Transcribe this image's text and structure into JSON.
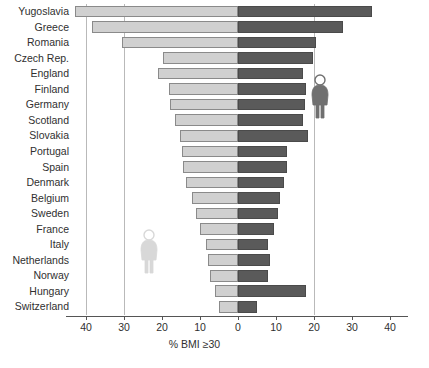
{
  "chart_data": {
    "type": "bar",
    "orientation": "horizontal-diverging",
    "title": "",
    "xlabel": "% BMI ≥30",
    "ylabel": "",
    "xlim": [
      -44,
      44
    ],
    "grid": true,
    "legend_position": "none",
    "x_ticks": [
      {
        "value": -40,
        "label": "40"
      },
      {
        "value": -30,
        "label": "30"
      },
      {
        "value": -20,
        "label": "20"
      },
      {
        "value": -10,
        "label": "10"
      },
      {
        "value": 0,
        "label": "0"
      },
      {
        "value": 10,
        "label": "10"
      },
      {
        "value": 20,
        "label": "20"
      },
      {
        "value": 30,
        "label": "30"
      },
      {
        "value": 40,
        "label": "40"
      }
    ],
    "gridlines": [
      -40,
      -30,
      20
    ],
    "categories": [
      "Yugoslavia",
      "Greece",
      "Romania",
      "Czech Rep.",
      "England",
      "Finland",
      "Germany",
      "Scotland",
      "Slovakia",
      "Portugal",
      "Spain",
      "Denmark",
      "Belgium",
      "Sweden",
      "France",
      "Italy",
      "Netherlands",
      "Norway",
      "Hungary",
      "Switzerland"
    ],
    "series": [
      {
        "name": "Women",
        "side": "left",
        "color": "#d0d0d0",
        "values": [
          42.8,
          38.3,
          30.5,
          19.7,
          21.0,
          18.2,
          18.0,
          16.5,
          15.2,
          14.7,
          14.5,
          13.7,
          12.2,
          11.0,
          10.0,
          8.4,
          8.0,
          7.5,
          6.0,
          5.0
        ]
      },
      {
        "name": "Men",
        "side": "right",
        "color": "#5a5a5a",
        "values": [
          35.3,
          27.5,
          20.5,
          19.8,
          17.0,
          18.0,
          17.5,
          17.0,
          18.5,
          13.0,
          13.0,
          12.0,
          11.0,
          10.5,
          9.5,
          8.0,
          8.5,
          8.0,
          18.0,
          5.0
        ]
      }
    ],
    "annotations": [
      {
        "name": "male-figure-icon",
        "x": 21.5,
        "category": "Finland",
        "color": "#707070"
      },
      {
        "name": "female-figure-icon",
        "x": -23.5,
        "category": "Italy",
        "color": "#d8d8d8"
      }
    ]
  }
}
